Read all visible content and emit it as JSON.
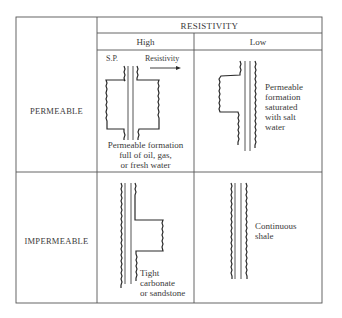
{
  "table": {
    "header": "RESISTIVITY",
    "columns": [
      "High",
      "Low"
    ],
    "rows": [
      {
        "label": "PERMEABLE",
        "high": {
          "sp_label": "S.P.",
          "resistivity_label": "Resistivity",
          "caption": [
            "Permeable formation",
            "full of oil, gas,",
            "or fresh water"
          ]
        },
        "low": {
          "caption": [
            "Permeable",
            "formation",
            "saturated",
            "with salt",
            "water"
          ]
        }
      },
      {
        "label": "IMPERMEABLE",
        "high": {
          "caption": [
            "Tight",
            "carbonate",
            "or sandstone"
          ]
        },
        "low": {
          "caption": [
            "Continuous",
            "shale"
          ]
        }
      }
    ]
  },
  "colors": {
    "line": "#3c3c3c",
    "grid": "#555555",
    "background": "#ffffff"
  }
}
